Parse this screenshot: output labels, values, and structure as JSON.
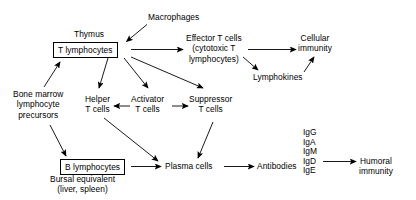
{
  "diagram": {
    "background_color": "#ffffff",
    "stroke_color": "#000000",
    "nodes": [
      {
        "id": "macrophages",
        "label": "Macrophages"
      },
      {
        "id": "thymus",
        "label": "Thymus"
      },
      {
        "id": "t_lymphocytes",
        "label": "T lymphocytes"
      },
      {
        "id": "effector_t_cells",
        "line1": "Effector T cells",
        "line2": "(cytotoxic T",
        "line3": "lymphocytes)"
      },
      {
        "id": "cellular_immunity",
        "line1": "Cellular",
        "line2": "immunity"
      },
      {
        "id": "lymphokines",
        "label": "Lymphokines"
      },
      {
        "id": "bone_marrow",
        "line1": "Bone marrow",
        "line2": "lymphocyte",
        "line3": "precursors"
      },
      {
        "id": "helper_t_cells",
        "line1": "Helper",
        "line2": "T cells"
      },
      {
        "id": "activator_t_cells",
        "line1": "Activator",
        "line2": "T cells"
      },
      {
        "id": "suppressor_t_cells",
        "line1": "Suppressor",
        "line2": "T cells"
      },
      {
        "id": "b_lymphocytes",
        "label": "B lymphocytes"
      },
      {
        "id": "bursal_equivalent",
        "line1": "Bursal equivalent",
        "line2": "(liver, spleen)"
      },
      {
        "id": "plasma_cells",
        "label": "Plasma cells"
      },
      {
        "id": "antibodies",
        "label": "Antibodies"
      },
      {
        "id": "humoral_immunity",
        "line1": "Humoral",
        "line2": "immunity"
      }
    ],
    "immunoglobulins": [
      "IgG",
      "IgA",
      "IgM",
      "IgD",
      "IgE"
    ],
    "edges": [
      {
        "from": "macrophages",
        "to": "t_lymphocytes"
      },
      {
        "from": "t_lymphocytes",
        "to": "effector_t_cells"
      },
      {
        "from": "t_lymphocytes",
        "to": "helper_t_cells"
      },
      {
        "from": "t_lymphocytes",
        "to": "activator_t_cells"
      },
      {
        "from": "t_lymphocytes",
        "to": "suppressor_t_cells"
      },
      {
        "from": "effector_t_cells",
        "to": "cellular_immunity"
      },
      {
        "from": "effector_t_cells",
        "to": "lymphokines"
      },
      {
        "from": "lymphokines",
        "to": "cellular_immunity"
      },
      {
        "from": "bone_marrow",
        "to": "t_lymphocytes"
      },
      {
        "from": "bone_marrow",
        "to": "b_lymphocytes"
      },
      {
        "from": "activator_t_cells",
        "to": "helper_t_cells"
      },
      {
        "from": "activator_t_cells",
        "to": "suppressor_t_cells"
      },
      {
        "from": "helper_t_cells",
        "to": "plasma_cells"
      },
      {
        "from": "suppressor_t_cells",
        "to": "plasma_cells"
      },
      {
        "from": "b_lymphocytes",
        "to": "plasma_cells"
      },
      {
        "from": "plasma_cells",
        "to": "antibodies"
      },
      {
        "from": "antibodies",
        "to": "humoral_immunity"
      }
    ]
  }
}
